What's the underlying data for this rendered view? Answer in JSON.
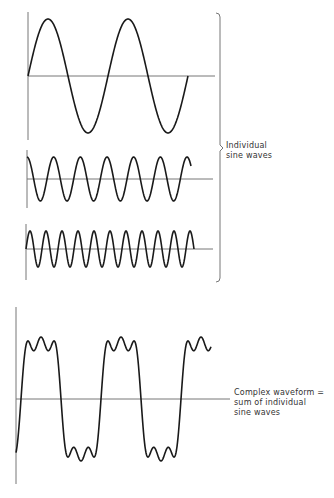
{
  "diagram": {
    "stroke_color": "#1a1a1a",
    "axis_color": "#777777",
    "individual_waves": [
      {
        "name": "fundamental",
        "axis_x": 28,
        "axis_top": 12,
        "axis_bottom": 140,
        "baseline_y": 76,
        "baseline_end": 215,
        "x_start": 28,
        "x_end": 188,
        "period": 80,
        "amplitude": 57,
        "phase": 0
      },
      {
        "name": "third-harmonic",
        "axis_x": 27,
        "axis_top": 150,
        "axis_bottom": 208,
        "baseline_y": 179,
        "baseline_end": 213,
        "x_start": 27,
        "x_end": 191,
        "period": 26.67,
        "amplitude": 22,
        "phase": 1.5708
      },
      {
        "name": "fifth-harmonic",
        "axis_x": 26,
        "axis_top": 224,
        "axis_bottom": 280,
        "baseline_y": 249,
        "baseline_end": 213,
        "x_start": 26,
        "x_end": 194,
        "period": 16,
        "amplitude": 18,
        "phase": 0
      }
    ],
    "complex_wave": {
      "axis_x": 16,
      "axis_top": 307,
      "axis_bottom": 484,
      "baseline_y": 399,
      "baseline_end": 230,
      "x_start": 16,
      "x_end": 211,
      "period": 80,
      "phase_offset": 25,
      "components": [
        {
          "harmonic": 1,
          "amplitude": 68,
          "phase": 0
        },
        {
          "harmonic": 3,
          "amplitude": 18,
          "phase": 1.5708
        },
        {
          "harmonic": 5,
          "amplitude": 12,
          "phase": 0
        }
      ]
    },
    "bracket": {
      "x": 220,
      "top": 13,
      "bottom": 282,
      "point_y": 148
    }
  },
  "labels": {
    "individual": [
      "Individual",
      "sine waves"
    ],
    "complex": [
      "Complex waveform =",
      "sum of individual",
      "sine waves"
    ]
  }
}
